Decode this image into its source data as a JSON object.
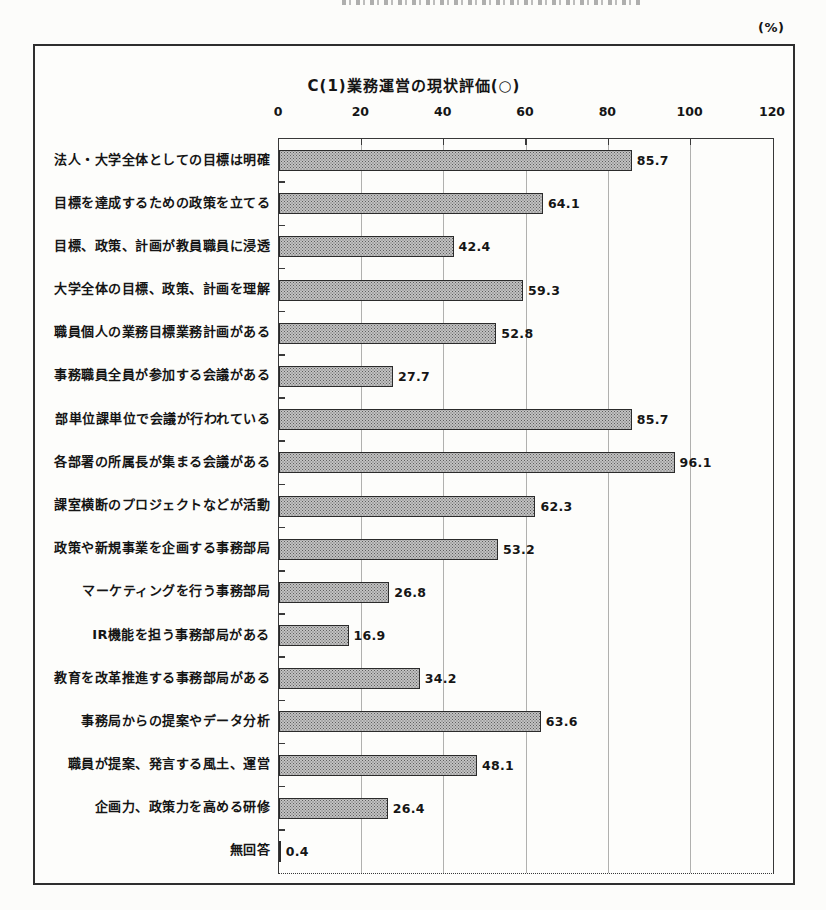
{
  "page": {
    "percent_label": "(%)"
  },
  "chart_data": {
    "type": "bar",
    "orientation": "horizontal",
    "title": "C(1)業務運営の現状評価(○)",
    "unit": "%",
    "categories": [
      "法人・大学全体としての目標は明確",
      "目標を達成するための政策を立てる",
      "目標、政策、計画が教員職員に浸透",
      "大学全体の目標、政策、計画を理解",
      "職員個人の業務目標業務計画がある",
      "事務職員全員が参加する会議がある",
      "部単位課単位で会議が行われている",
      "各部署の所属長が集まる会議がある",
      "課室横断のプロジェクトなどが活動",
      "政策や新規事業を企画する事務部局",
      "マーケティングを行う事務部局",
      "IR機能を担う事務部局がある",
      "教育を改革推進する事務部局がある",
      "事務局からの提案やデータ分析",
      "職員が提案、発言する風土、運営",
      "企画力、政策力を高める研修",
      "無回答"
    ],
    "values": [
      85.7,
      64.1,
      42.4,
      59.3,
      52.8,
      27.7,
      85.7,
      96.1,
      62.3,
      53.2,
      26.8,
      16.9,
      34.2,
      63.6,
      48.1,
      26.4,
      0.4
    ],
    "xlim": [
      0,
      120
    ],
    "xticks": [
      0,
      20,
      40,
      60,
      80,
      100,
      120
    ],
    "grid": "vertical",
    "legend": "none",
    "colors": {
      "bar_fill": "#c2c2c2",
      "bar_dot": "#5d5d5d",
      "bar_border": "#2b2b2b",
      "grid": "#b0b0ae",
      "frame_line": "#383838",
      "text": "#151515"
    }
  }
}
